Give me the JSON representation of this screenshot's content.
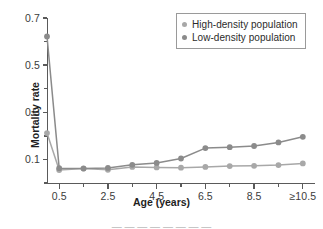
{
  "chart_data": {
    "type": "line",
    "title": "",
    "xlabel": "Age (years)",
    "ylabel": "Mortality rate",
    "xlim": [
      0,
      11
    ],
    "ylim": [
      0,
      0.7
    ],
    "grid": false,
    "legend_position": "top-right",
    "x": [
      0,
      0.5,
      1.5,
      2.5,
      3.5,
      4.5,
      5.5,
      6.5,
      7.5,
      8.5,
      9.5,
      10.5
    ],
    "x_tick_labels_major": [
      "0.5",
      "2.5",
      "4.5",
      "6.5",
      "8.5",
      "≥10.5"
    ],
    "x_tick_values_major": [
      0.5,
      2.5,
      4.5,
      6.5,
      8.5,
      10.5
    ],
    "x_tick_values_minor": [
      1.5,
      3.5,
      5.5,
      7.5,
      9.5
    ],
    "y_tick_labels_major": [
      "0.1",
      "0.3",
      "0.5",
      "0.7"
    ],
    "y_tick_values_major": [
      0.1,
      0.3,
      0.5,
      0.7
    ],
    "y_tick_values_minor": [
      0.0,
      0.2,
      0.4,
      0.6
    ],
    "series": [
      {
        "name": "High-density population",
        "color": "#a8a8a8",
        "values": [
          0.212,
          0.055,
          0.062,
          0.056,
          0.068,
          0.066,
          0.065,
          0.068,
          0.072,
          0.073,
          0.076,
          0.083
        ]
      },
      {
        "name": "Low-density population",
        "color": "#8b8b8b",
        "values": [
          0.622,
          0.063,
          0.061,
          0.064,
          0.077,
          0.085,
          0.104,
          0.148,
          0.152,
          0.157,
          0.172,
          0.196
        ]
      }
    ]
  },
  "legend": {
    "entries": [
      {
        "label": "High-density population",
        "color": "#a8a8a8"
      },
      {
        "label": "Low-density population",
        "color": "#8b8b8b"
      }
    ]
  },
  "axes": {
    "x_title": "Age (years)",
    "y_title": "Mortality rate"
  },
  "caption": {
    "partial_text": "— — — — — — — —"
  },
  "colors": {
    "axis": "#5a5a5a",
    "text": "#1f1f1f",
    "tick_text": "#3b3b3b",
    "legend_border": "#9a9a9a",
    "background": "#ffffff"
  }
}
